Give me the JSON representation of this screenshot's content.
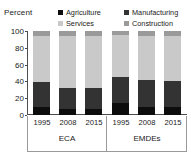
{
  "chart_data": {
    "type": "bar",
    "subtype": "stacked-bar-100",
    "title": "",
    "ylabel": "Percent",
    "xlabel": "",
    "ylim": [
      0,
      100
    ],
    "yticks": [
      0,
      20,
      40,
      60,
      80,
      100
    ],
    "ytick_labels": [
      "0",
      "20",
      "40",
      "60",
      "80",
      "100"
    ],
    "grid": false,
    "legend_position": "top",
    "categories": [
      "1995",
      "2008",
      "2015",
      "1995",
      "2008",
      "2015"
    ],
    "groups": [
      {
        "label": "ECA",
        "categories": [
          "1995",
          "2008",
          "2015"
        ]
      },
      {
        "label": "EMDEs",
        "categories": [
          "1995",
          "2008",
          "2015"
        ]
      }
    ],
    "series": [
      {
        "name": "Agriculture",
        "color": "#0d0d0d",
        "values": [
          9,
          7,
          7,
          14,
          10,
          10
        ]
      },
      {
        "name": "Manufacturing",
        "color": "#333333",
        "values": [
          30,
          25,
          25,
          31,
          32,
          30
        ]
      },
      {
        "name": "Services",
        "color": "#c9c9c9",
        "values": [
          55,
          62,
          62,
          50,
          52,
          54
        ]
      },
      {
        "name": "Construction",
        "color": "#9a9a9a",
        "values": [
          6,
          6,
          6,
          5,
          6,
          6
        ]
      }
    ],
    "legend": [
      {
        "label": "Agriculture",
        "color": "#0d0d0d"
      },
      {
        "label": "Manufacturing",
        "color": "#333333"
      },
      {
        "label": "Services",
        "color": "#c9c9c9"
      },
      {
        "label": "Construction",
        "color": "#9a9a9a"
      }
    ],
    "stack_order_bottom_to_top": [
      "Agriculture",
      "Manufacturing",
      "Services",
      "Construction"
    ],
    "colors": {
      "agriculture": "#0d0d0d",
      "manufacturing": "#333333",
      "services": "#c9c9c9",
      "construction": "#9a9a9a",
      "axis": "#4d4d4d",
      "text": "#1a1a1a",
      "background": "#ffffff"
    }
  }
}
